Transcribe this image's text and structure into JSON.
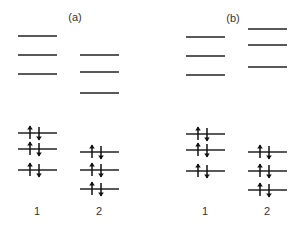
{
  "panels": [
    {
      "label": "(a)",
      "columns": [
        {
          "label": "1",
          "top_levels": 3,
          "bottom_levels": 3,
          "electrons_per_level": 2
        },
        {
          "label": "2",
          "top_levels": 3,
          "bottom_levels": 3,
          "electrons_per_level": 2
        }
      ]
    },
    {
      "label": "(b)",
      "columns": [
        {
          "label": "1",
          "top_levels": 3,
          "bottom_levels": 3,
          "electrons_per_level": 2
        },
        {
          "label": "2",
          "top_levels": 3,
          "bottom_levels": 3,
          "electrons_per_level": 2
        }
      ]
    }
  ],
  "electron_symbols": {
    "up": "spin-up-arrow",
    "down": "spin-down-arrow"
  }
}
